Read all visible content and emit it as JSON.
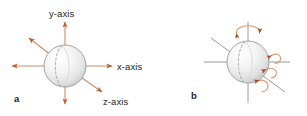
{
  "figure": {
    "background_color": "#ffffff",
    "width": 307,
    "height": 116,
    "arrow_color": "#c0622a",
    "axis_line_color_a": "#c8906a",
    "axis_line_color_b": "#8f8f8f",
    "rotation_arrow_color": "#c0622a",
    "rotation_arc_color": "#d79a72",
    "sphere_outline_color": "#9a9a9a",
    "sphere_fill_light": "#fdfdfd",
    "sphere_fill_dark": "#cfcfcf",
    "meridian_color": "#b0b0b0",
    "text_color": "#231f20"
  },
  "panel_a": {
    "id": "a",
    "label": "a",
    "caption_labels": {
      "y_axis": "y-axis",
      "x_axis": "x-axis",
      "z_axis": "z-axis"
    },
    "axes": [
      {
        "name": "y-axis",
        "direction": "up",
        "has_arrowhead": true
      },
      {
        "name": "x-axis",
        "direction": "right",
        "has_arrowhead": true
      },
      {
        "name": "x-axis-negative",
        "direction": "left",
        "has_arrowhead": true
      },
      {
        "name": "y-axis-negative",
        "direction": "down",
        "has_arrowhead": true
      },
      {
        "name": "z-axis",
        "direction": "down-right",
        "has_arrowhead": true
      },
      {
        "name": "z-axis-negative",
        "direction": "up-left",
        "has_arrowhead": true
      }
    ],
    "sphere": {
      "cx": 65,
      "cy": 66,
      "r": 21
    }
  },
  "panel_b": {
    "id": "b",
    "label": "b",
    "caption_labels": {},
    "axes": [
      {
        "name": "vertical-axis",
        "direction": "vertical",
        "has_arrowhead": false
      },
      {
        "name": "horizontal-axis",
        "direction": "horizontal",
        "has_arrowhead": false
      },
      {
        "name": "diagonal-axis",
        "direction": "diagonal",
        "has_arrowhead": false
      }
    ],
    "rotation_arrows": [
      {
        "name": "rotation-about-vertical-axis",
        "position": "top"
      },
      {
        "name": "rotation-about-horizontal-axis-upper",
        "position": "right-upper"
      },
      {
        "name": "rotation-about-horizontal-axis-lower",
        "position": "right-middle"
      },
      {
        "name": "rotation-about-diagonal-axis",
        "position": "right-lower"
      }
    ],
    "sphere": {
      "cx": 248,
      "cy": 62,
      "r": 21
    }
  }
}
